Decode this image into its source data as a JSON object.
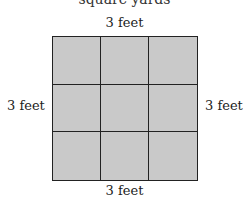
{
  "diagram": {
    "top_cut_text": "square yards",
    "labels": {
      "top": "3 feet",
      "bottom": "3 feet",
      "left": "3 feet",
      "right": "3 feet"
    },
    "grid": {
      "rows": 3,
      "cols": 3,
      "fill_color": "#c9c9c9",
      "line_color": "#222222"
    }
  }
}
